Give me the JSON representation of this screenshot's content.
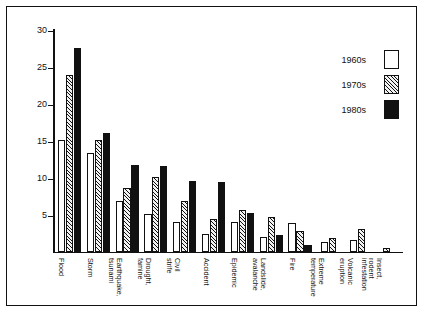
{
  "chart_data": {
    "type": "bar",
    "title": "",
    "xlabel": "",
    "ylabel": "",
    "ylim": [
      0,
      30
    ],
    "yticks": [
      5,
      10,
      15,
      20,
      25,
      30
    ],
    "grid": false,
    "legend_position": "top-right",
    "categories": [
      "Flood",
      "Storm",
      "Earthquake,\ntsunami",
      "Drought,\nfamine",
      "Civil\nstrife",
      "Accident",
      "Epidemic",
      "Landslide,\navalanche",
      "Fire",
      "Extreme\ntemperature",
      "Volcanic\neruption",
      "Insect,\nrodent\ninfestation"
    ],
    "series": [
      {
        "name": "1960s",
        "fill": "white",
        "values": [
          15.0,
          13.3,
          6.8,
          5.0,
          4.0,
          2.3,
          4.0,
          1.9,
          3.8,
          1.3,
          1.5,
          0.0
        ]
      },
      {
        "name": "1970s",
        "fill": "hatched",
        "values": [
          23.8,
          15.0,
          8.6,
          10.0,
          6.8,
          4.4,
          5.6,
          4.7,
          2.7,
          1.8,
          3.0,
          0.5
        ]
      },
      {
        "name": "1980s",
        "fill": "black",
        "values": [
          27.5,
          16.0,
          11.7,
          11.5,
          9.5,
          9.4,
          5.2,
          2.2,
          0.9,
          0.0,
          0.0,
          0.0
        ]
      }
    ]
  },
  "legend": {
    "items": [
      {
        "label": "1960s",
        "swatch": "white"
      },
      {
        "label": "1970s",
        "swatch": "hatched"
      },
      {
        "label": "1980s",
        "swatch": "black"
      }
    ]
  },
  "colors": {
    "axis": "#111111",
    "frame": "#111111",
    "background": "#ffffff"
  }
}
